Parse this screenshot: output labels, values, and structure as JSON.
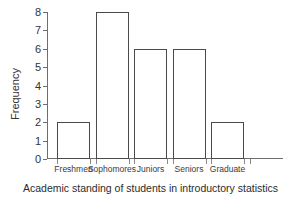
{
  "chart_data": {
    "type": "bar",
    "title": "",
    "caption": "Academic standing of students in introductory statistics",
    "categories": [
      "Freshmen",
      "Sophomores",
      "Juniors",
      "Seniors",
      "Graduate"
    ],
    "values": [
      2,
      8,
      6,
      6,
      2
    ],
    "xlabel": "",
    "ylabel": "Frequency",
    "ylim": [
      0,
      8
    ],
    "yticks": [
      0,
      1,
      2,
      3,
      4,
      5,
      6,
      7,
      8
    ],
    "ytick_labels": [
      "0",
      "1",
      "2",
      "3",
      "4",
      "5",
      "6",
      "7",
      "8"
    ],
    "grid": false,
    "legend": false,
    "bar_fill": "#ffffff",
    "bar_edge": "#4a4a4a",
    "axis_color": "#6e6e6e"
  }
}
